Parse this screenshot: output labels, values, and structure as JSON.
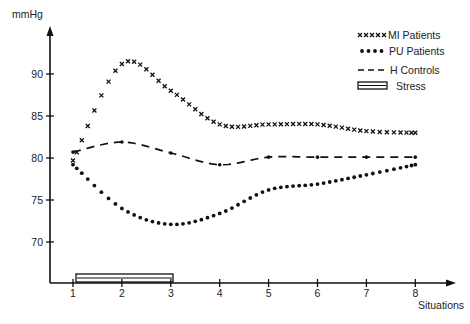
{
  "chart_data": {
    "type": "line",
    "title": "",
    "xlabel": "Situations",
    "ylabel": "mmHg",
    "x": [
      1,
      2,
      3,
      4,
      5,
      6,
      7,
      8
    ],
    "x_ticks": [
      "1",
      "2",
      "3",
      "4",
      "5",
      "6",
      "7",
      "8"
    ],
    "y_ticks": [
      "70",
      "75",
      "80",
      "85",
      "90"
    ],
    "ylim": [
      65,
      95
    ],
    "grid": false,
    "legend_position": "top-right",
    "series": [
      {
        "name": "MI Patients",
        "style": "crosses",
        "values": [
          79.7,
          91.2,
          88.0,
          84.0,
          84.0,
          84.0,
          83.2,
          83.0
        ]
      },
      {
        "name": "PU Patients",
        "style": "dots",
        "values": [
          79.2,
          74.0,
          72.1,
          73.4,
          76.2,
          76.9,
          78.0,
          79.2
        ]
      },
      {
        "name": "H Controls",
        "style": "dashed",
        "values": [
          80.7,
          81.9,
          80.6,
          79.2,
          80.1,
          80.1,
          80.1,
          80.1
        ]
      }
    ],
    "annotations": [
      {
        "name": "Stress",
        "type": "bar",
        "x_start": 1,
        "x_end": 3
      }
    ]
  },
  "legend": {
    "items": [
      {
        "label": "MI Patients"
      },
      {
        "label": "PU Patients"
      },
      {
        "label": "H Controls"
      },
      {
        "label": "Stress"
      }
    ]
  },
  "axes": {
    "ylabel": "mmHg",
    "xlabel": "Situations"
  }
}
